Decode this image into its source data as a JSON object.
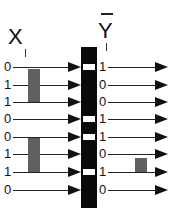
{
  "header": {
    "input_label": "X",
    "input_subscript": "i",
    "output_label": "Y",
    "output_subscript": "i",
    "output_overline": true
  },
  "rows": [
    {
      "input": "0",
      "output": "1"
    },
    {
      "input": "1",
      "output": "0"
    },
    {
      "input": "1",
      "output": "0"
    },
    {
      "input": "0",
      "output": "1"
    },
    {
      "input": "0",
      "output": "1"
    },
    {
      "input": "1",
      "output": "0"
    },
    {
      "input": "1",
      "output": "1"
    },
    {
      "input": "0",
      "output": "0"
    }
  ],
  "highlights": {
    "input_groups": [
      [
        1,
        2
      ],
      [
        5,
        6
      ]
    ],
    "output_groups": [
      [
        5,
        6
      ]
    ]
  },
  "colors": {
    "bar": "#0a0a0a",
    "highlight": "#777777",
    "arrow": "#111111"
  }
}
